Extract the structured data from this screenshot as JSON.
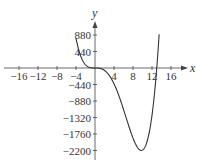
{
  "chart_data": {
    "type": "line",
    "title": "",
    "xlabel": "x",
    "ylabel": "y",
    "xlim": [
      -18,
      18
    ],
    "ylim": [
      -2400,
      1200
    ],
    "grid": false,
    "x_ticks": [
      -16,
      -12,
      -8,
      -4,
      4,
      8,
      12,
      16
    ],
    "x_tick_labels": [
      "−16",
      "−12",
      "−8",
      "−4",
      "4",
      "8",
      "12",
      "16"
    ],
    "y_ticks": [
      880,
      440,
      -440,
      -880,
      -1320,
      -1760,
      -2200
    ],
    "y_tick_labels": [
      "880",
      "440",
      "−440",
      "−880",
      "−1320",
      "−1760",
      "−2200"
    ],
    "series": [
      {
        "name": "f(x)",
        "approx_formula": "0.73*x^3*(x-13)",
        "x": [
          -4,
          -3,
          -2,
          -1,
          0,
          1,
          2,
          3,
          4,
          5,
          6,
          7,
          8,
          9,
          9.75,
          10,
          11,
          12,
          13,
          13.5
        ],
        "y": [
          794,
          315,
          88,
          10,
          0,
          -9,
          -64,
          -197,
          -420,
          -730,
          -1104,
          -1502,
          -1869,
          -2128,
          -2200,
          -2190,
          -1943,
          -1261,
          0,
          898
        ]
      }
    ],
    "color": "#333333"
  }
}
